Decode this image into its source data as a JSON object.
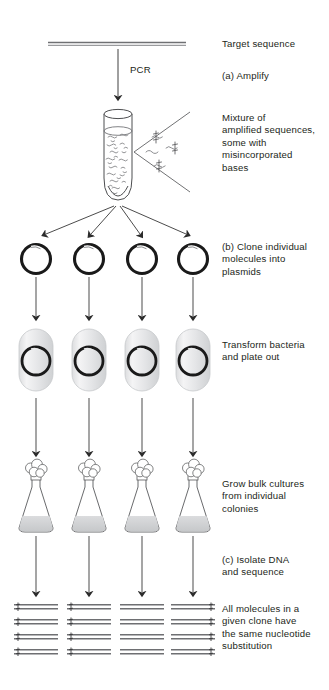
{
  "figure": {
    "title_alt": "Cloning and sequencing of PCR products to detect misincorporated bases",
    "colors": {
      "ink": "#231f20",
      "line": "#58595b",
      "plasmid": "#1a1a1a",
      "cell_fill": "#e8e9ea",
      "cell_stroke": "#c7c9cb",
      "liquid": "#d4d5d7",
      "dna_bar": "#6d6e71",
      "background": "#ffffff"
    }
  },
  "captions": [
    {
      "id": "target-sequence",
      "text": "Target sequence",
      "x": 222,
      "y": 40
    },
    {
      "id": "step-a-amplify",
      "text": "(a) Amplify",
      "x": 222,
      "y": 73
    },
    {
      "id": "mixture-of-amplified",
      "text": "Mixture of\namplified sequences,\nsome with\nmisincorporated\nbases",
      "x": 222,
      "y": 115
    },
    {
      "id": "step-b-clone",
      "text": "(b) Clone individual\nmolecules into\nplasmids",
      "x": 222,
      "y": 243
    },
    {
      "id": "transform-bacteria",
      "text": "Transform bacteria\nand  plate out",
      "x": 222,
      "y": 341
    },
    {
      "id": "grow-bulk-cultures",
      "text": "Grow bulk cultures\nfrom individual\ncolonies",
      "x": 222,
      "y": 480
    },
    {
      "id": "step-c-isolate-dna",
      "text": "(c) Isolate DNA\nand sequence",
      "x": 222,
      "y": 556
    },
    {
      "id": "all-molecules-same",
      "text": "All molecules in a\ngiven clone have\nthe same nucleotide\nsubstitution",
      "x": 222,
      "y": 607
    }
  ],
  "arrow_labels": [
    {
      "id": "pcr-label",
      "text": "PCR",
      "x": 130,
      "y": 70
    }
  ],
  "stages": {
    "target_line": {
      "name": "Target sequence duplex",
      "x1": 48,
      "x2": 186,
      "y": 44
    },
    "tube": {
      "name": "Reaction tube with amplified sequences",
      "cx": 118,
      "top": 108,
      "bottom": 198
    },
    "magnifier_fan": {
      "name": "Exploded view of amplified strands",
      "apex_x": 134,
      "apex_y": 152
    },
    "plasmid_row": {
      "name": "Cloned plasmids",
      "count": 4,
      "cy": 259,
      "radius": 15,
      "columns": [
        36,
        89,
        142,
        193
      ]
    },
    "bacteria_row": {
      "name": "Transformed bacteria",
      "count": 4,
      "cy": 358,
      "columns": [
        36,
        89,
        142,
        193
      ]
    },
    "flask_row": {
      "name": "Bulk culture flasks",
      "count": 4,
      "base_y": 527,
      "columns": [
        36,
        89,
        142,
        193
      ]
    },
    "dna_groups": {
      "name": "Sequenced DNA molecules per clone",
      "groups": 4,
      "molecules_per_group": 4,
      "columns": [
        36,
        89,
        142,
        193
      ],
      "substitution_positions": [
        "left",
        "left",
        "none",
        "right"
      ],
      "top_y": 604,
      "row_spacing": 15
    }
  }
}
